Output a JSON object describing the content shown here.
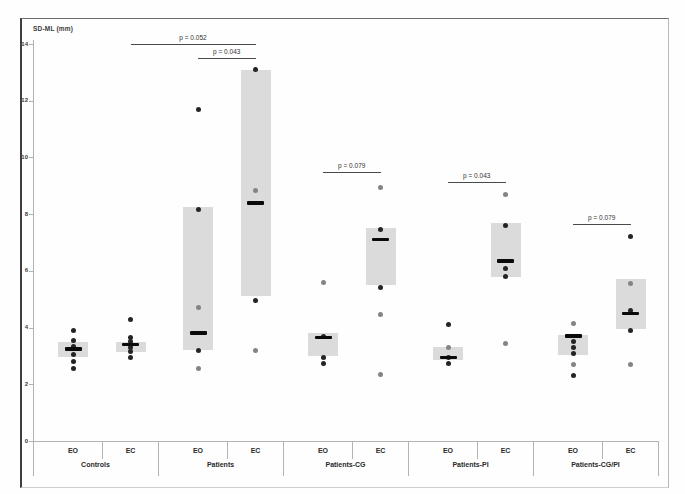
{
  "chart_data": {
    "type": "scatter",
    "title": "",
    "ylabel": "SD-ML (mm)",
    "xlabel": "",
    "ylim": [
      0,
      14
    ],
    "yticks": [
      0,
      2,
      4,
      6,
      8,
      10,
      12,
      14
    ],
    "grid": false,
    "legend": false,
    "colors": {
      "range_box": "#dbdbdb",
      "dot_dark": "#242424",
      "dot_grey": "#848484",
      "median_bar": "#0a0a0a",
      "axis_line": "#b3b3b3",
      "p_line": "#4a4a4a"
    },
    "groups": [
      {
        "label": "Controls",
        "conditions": [
          {
            "label": "EO",
            "median": 3.25,
            "box": [
              2.95,
              3.5
            ],
            "points": [
              {
                "v": 3.9,
                "shade": "dark"
              },
              {
                "v": 3.55,
                "shade": "dark"
              },
              {
                "v": 3.35,
                "shade": "dark"
              },
              {
                "v": 3.05,
                "shade": "dark"
              },
              {
                "v": 2.8,
                "shade": "dark"
              },
              {
                "v": 2.55,
                "shade": "dark"
              }
            ]
          },
          {
            "label": "EC",
            "median": 3.4,
            "box": [
              3.15,
              3.5
            ],
            "points": [
              {
                "v": 4.3,
                "shade": "dark"
              },
              {
                "v": 3.65,
                "shade": "dark"
              },
              {
                "v": 3.5,
                "shade": "dark"
              },
              {
                "v": 3.3,
                "shade": "dark"
              },
              {
                "v": 3.15,
                "shade": "dark"
              },
              {
                "v": 2.95,
                "shade": "dark"
              }
            ]
          }
        ]
      },
      {
        "label": "Patients",
        "conditions": [
          {
            "label": "EO",
            "median": 3.8,
            "box": [
              3.2,
              8.25
            ],
            "points": [
              {
                "v": 11.7,
                "shade": "dark"
              },
              {
                "v": 8.15,
                "shade": "dark"
              },
              {
                "v": 4.7,
                "shade": "grey"
              },
              {
                "v": 3.2,
                "shade": "dark"
              },
              {
                "v": 2.55,
                "shade": "grey"
              }
            ]
          },
          {
            "label": "EC",
            "median": 8.4,
            "box": [
              5.1,
              13.1
            ],
            "points": [
              {
                "v": 13.1,
                "shade": "dark"
              },
              {
                "v": 8.85,
                "shade": "grey"
              },
              {
                "v": 4.95,
                "shade": "dark"
              },
              {
                "v": 3.2,
                "shade": "grey"
              }
            ]
          }
        ]
      },
      {
        "label": "Patients-CG",
        "conditions": [
          {
            "label": "EO",
            "median": 3.65,
            "box": [
              3.0,
              3.8
            ],
            "points": [
              {
                "v": 5.6,
                "shade": "grey"
              },
              {
                "v": 3.7,
                "shade": "dark"
              },
              {
                "v": 2.95,
                "shade": "dark"
              },
              {
                "v": 2.75,
                "shade": "dark"
              }
            ]
          },
          {
            "label": "EC",
            "median": 7.1,
            "box": [
              5.5,
              7.5
            ],
            "points": [
              {
                "v": 8.95,
                "shade": "grey"
              },
              {
                "v": 7.45,
                "shade": "dark"
              },
              {
                "v": 5.4,
                "shade": "dark"
              },
              {
                "v": 4.45,
                "shade": "grey"
              },
              {
                "v": 2.35,
                "shade": "grey"
              }
            ]
          }
        ]
      },
      {
        "label": "Patients-PI",
        "conditions": [
          {
            "label": "EO",
            "median": 2.95,
            "box": [
              2.85,
              3.3
            ],
            "points": [
              {
                "v": 4.1,
                "shade": "dark"
              },
              {
                "v": 3.3,
                "shade": "grey"
              },
              {
                "v": 2.95,
                "shade": "dark"
              },
              {
                "v": 2.75,
                "shade": "dark"
              }
            ]
          },
          {
            "label": "EC",
            "median": 6.35,
            "box": [
              5.8,
              7.7
            ],
            "points": [
              {
                "v": 8.7,
                "shade": "grey"
              },
              {
                "v": 7.6,
                "shade": "dark"
              },
              {
                "v": 6.1,
                "shade": "dark"
              },
              {
                "v": 5.8,
                "shade": "dark"
              },
              {
                "v": 3.45,
                "shade": "grey"
              }
            ]
          }
        ]
      },
      {
        "label": "Patients-CG/PI",
        "conditions": [
          {
            "label": "EO",
            "median": 3.7,
            "box": [
              3.05,
              3.75
            ],
            "points": [
              {
                "v": 4.15,
                "shade": "grey"
              },
              {
                "v": 3.5,
                "shade": "dark"
              },
              {
                "v": 3.3,
                "shade": "dark"
              },
              {
                "v": 3.1,
                "shade": "dark"
              },
              {
                "v": 2.7,
                "shade": "grey"
              },
              {
                "v": 2.3,
                "shade": "dark"
              }
            ]
          },
          {
            "label": "EC",
            "median": 4.5,
            "box": [
              3.95,
              5.7
            ],
            "points": [
              {
                "v": 7.2,
                "shade": "dark"
              },
              {
                "v": 5.55,
                "shade": "grey"
              },
              {
                "v": 4.6,
                "shade": "dark"
              },
              {
                "v": 3.9,
                "shade": "dark"
              },
              {
                "v": 2.7,
                "shade": "grey"
              }
            ]
          }
        ]
      }
    ],
    "annotations": [
      {
        "label": "p = 0.052",
        "between": [
          "Controls.EC",
          "Patients.EC"
        ],
        "y": 14.0
      },
      {
        "label": "p = 0.043",
        "between": [
          "Patients.EO",
          "Patients.EC"
        ],
        "y": 13.5
      },
      {
        "label": "p = 0.079",
        "between": [
          "Patients-CG.EO",
          "Patients-CG.EC"
        ],
        "y": 9.5
      },
      {
        "label": "p = 0.043",
        "between": [
          "Patients-PI.EO",
          "Patients-PI.EC"
        ],
        "y": 9.15
      },
      {
        "label": "p = 0.079",
        "between": [
          "Patients-CG/PI.EO",
          "Patients-CG/PI.EC"
        ],
        "y": 7.65
      }
    ]
  }
}
